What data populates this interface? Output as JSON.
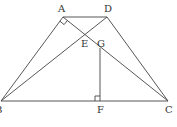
{
  "diagram": {
    "title": "",
    "points": {
      "A": {
        "label": "A",
        "x": 63,
        "y": 17
      },
      "D": {
        "label": "D",
        "x": 107,
        "y": 17
      },
      "B": {
        "label": "B",
        "x": 1,
        "y": 101
      },
      "C": {
        "label": "C",
        "x": 168,
        "y": 101
      },
      "E": {
        "label": "E",
        "x": 84,
        "y": 34
      },
      "G": {
        "label": "G",
        "x": 100,
        "y": 47
      },
      "F": {
        "label": "F",
        "x": 100,
        "y": 101
      }
    },
    "segments": [
      "AD",
      "AB",
      "DC",
      "BC",
      "AC",
      "BD",
      "GF"
    ],
    "right_angles": [
      "A",
      "F"
    ],
    "colors": {
      "line": "#444444",
      "text": "#333333",
      "background": "#ffffff"
    }
  }
}
